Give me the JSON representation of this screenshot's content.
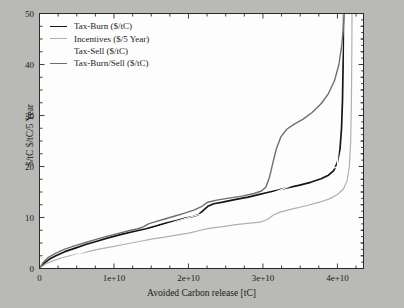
{
  "chart_data": {
    "type": "line",
    "title": "",
    "xlabel": "Avoided Carbon release [tC]",
    "ylabel": "$/tC   $/tC/5 Year",
    "xlim": [
      0,
      43500000000
    ],
    "ylim": [
      0,
      50
    ],
    "grid": false,
    "legend_position": "upper-left",
    "xticks": [
      {
        "value": 0,
        "label": "0"
      },
      {
        "value": 10000000000,
        "label": "1e+10"
      },
      {
        "value": 20000000000,
        "label": "2e+10"
      },
      {
        "value": 30000000000,
        "label": "3e+10"
      },
      {
        "value": 40000000000,
        "label": "4e+10"
      }
    ],
    "yticks": [
      {
        "value": 0,
        "label": "0"
      },
      {
        "value": 10,
        "label": "10"
      },
      {
        "value": 20,
        "label": "20"
      },
      {
        "value": 30,
        "label": "30"
      },
      {
        "value": 40,
        "label": "40"
      },
      {
        "value": 50,
        "label": "50"
      }
    ],
    "x_minor_interval": 2500000000,
    "y_minor_interval": 2.5,
    "series": [
      {
        "name": "Tax-Burn ($/tC)",
        "color": "#151515",
        "width": 1.7,
        "points": [
          [
            0,
            0
          ],
          [
            600000000,
            1.0
          ],
          [
            1300000000,
            1.8
          ],
          [
            2200000000,
            2.5
          ],
          [
            3400000000,
            3.3
          ],
          [
            4800000000,
            4.0
          ],
          [
            6200000000,
            4.7
          ],
          [
            7600000000,
            5.3
          ],
          [
            9200000000,
            6.0
          ],
          [
            11000000000,
            6.7
          ],
          [
            12800000000,
            7.3
          ],
          [
            14300000000,
            7.8
          ],
          [
            15600000000,
            8.3
          ],
          [
            17000000000,
            8.9
          ],
          [
            18400000000,
            9.4
          ],
          [
            19600000000,
            9.9
          ],
          [
            20600000000,
            10.2
          ],
          [
            21400000000,
            10.6
          ],
          [
            22000000000,
            11.4
          ],
          [
            22600000000,
            12.2
          ],
          [
            23400000000,
            12.7
          ],
          [
            24600000000,
            13.0
          ],
          [
            26200000000,
            13.5
          ],
          [
            28000000000,
            14.0
          ],
          [
            29400000000,
            14.5
          ],
          [
            30600000000,
            14.9
          ],
          [
            31800000000,
            15.3
          ],
          [
            33200000000,
            15.8
          ],
          [
            34800000000,
            16.3
          ],
          [
            36400000000,
            16.9
          ],
          [
            37800000000,
            17.6
          ],
          [
            38800000000,
            18.3
          ],
          [
            39500000000,
            19.2
          ],
          [
            40000000000,
            20.8
          ],
          [
            40350000000,
            23.5
          ],
          [
            40550000000,
            27.5
          ],
          [
            40680000000,
            33.0
          ],
          [
            40760000000,
            40.0
          ],
          [
            40800000000,
            47.0
          ],
          [
            40820000000,
            50
          ]
        ]
      },
      {
        "name": "Incentives ($/5 Year)",
        "color": "#b0b0b0",
        "width": 1.2,
        "points": [
          [
            0,
            0
          ],
          [
            800000000,
            0.9
          ],
          [
            1800000000,
            1.5
          ],
          [
            3000000000,
            2.1
          ],
          [
            4600000000,
            2.7
          ],
          [
            6200000000,
            3.2
          ],
          [
            8000000000,
            3.8
          ],
          [
            9800000000,
            4.3
          ],
          [
            11600000000,
            4.8
          ],
          [
            13400000000,
            5.3
          ],
          [
            15200000000,
            5.8
          ],
          [
            17000000000,
            6.2
          ],
          [
            18600000000,
            6.6
          ],
          [
            20200000000,
            7.0
          ],
          [
            21600000000,
            7.5
          ],
          [
            23000000000,
            7.9
          ],
          [
            24600000000,
            8.2
          ],
          [
            26400000000,
            8.6
          ],
          [
            28200000000,
            8.9
          ],
          [
            29600000000,
            9.1
          ],
          [
            30600000000,
            9.6
          ],
          [
            31400000000,
            10.5
          ],
          [
            32400000000,
            11.1
          ],
          [
            34000000000,
            11.7
          ],
          [
            35800000000,
            12.3
          ],
          [
            37600000000,
            13.0
          ],
          [
            39000000000,
            13.7
          ],
          [
            40000000000,
            14.5
          ],
          [
            40800000000,
            15.6
          ],
          [
            41300000000,
            17.2
          ],
          [
            41600000000,
            20.0
          ],
          [
            41780000000,
            25.0
          ],
          [
            41880000000,
            33.0
          ],
          [
            41930000000,
            42.0
          ],
          [
            41960000000,
            50
          ]
        ]
      },
      {
        "name": "Tax-Sell ($/tC)",
        "color": "#fdfdfd",
        "width": 1.2,
        "points": [
          [
            0,
            0
          ],
          [
            10000000000,
            5.5
          ],
          [
            20000000000,
            10.0
          ],
          [
            30000000000,
            14.0
          ],
          [
            40000000000,
            20.0
          ],
          [
            40800000000,
            50
          ]
        ]
      },
      {
        "name": "Tax-Burn/Sell ($/tC)",
        "color": "#6e6e6e",
        "width": 1.4,
        "points": [
          [
            0,
            0
          ],
          [
            500000000,
            1.2
          ],
          [
            1200000000,
            2.2
          ],
          [
            2200000000,
            3.0
          ],
          [
            3400000000,
            3.8
          ],
          [
            4800000000,
            4.5
          ],
          [
            6200000000,
            5.1
          ],
          [
            7600000000,
            5.7
          ],
          [
            9000000000,
            6.3
          ],
          [
            10600000000,
            6.9
          ],
          [
            12000000000,
            7.4
          ],
          [
            13200000000,
            7.8
          ],
          [
            14000000000,
            8.2
          ],
          [
            14700000000,
            8.8
          ],
          [
            15600000000,
            9.2
          ],
          [
            16800000000,
            9.7
          ],
          [
            18200000000,
            10.3
          ],
          [
            19600000000,
            10.9
          ],
          [
            20800000000,
            11.5
          ],
          [
            21800000000,
            12.2
          ],
          [
            22600000000,
            13.0
          ],
          [
            23800000000,
            13.4
          ],
          [
            25400000000,
            13.8
          ],
          [
            27200000000,
            14.2
          ],
          [
            28800000000,
            14.7
          ],
          [
            29800000000,
            15.2
          ],
          [
            30400000000,
            16.0
          ],
          [
            30900000000,
            18.0
          ],
          [
            31300000000,
            20.5
          ],
          [
            31800000000,
            23.5
          ],
          [
            32400000000,
            25.8
          ],
          [
            33200000000,
            27.3
          ],
          [
            34200000000,
            28.3
          ],
          [
            35400000000,
            29.3
          ],
          [
            36600000000,
            30.6
          ],
          [
            37800000000,
            32.3
          ],
          [
            38800000000,
            34.3
          ],
          [
            39600000000,
            36.8
          ],
          [
            40200000000,
            40.0
          ],
          [
            40600000000,
            44.0
          ],
          [
            40820000000,
            48.0
          ],
          [
            40900000000,
            50
          ]
        ]
      }
    ]
  },
  "legend": {
    "entries": [
      {
        "label": "Tax-Burn ($/tC)",
        "color": "#151515"
      },
      {
        "label": "Incentives ($/5 Year)",
        "color": "#b0b0b0"
      },
      {
        "label": "Tax-Sell ($/tC)",
        "color": "#fdfdfd"
      },
      {
        "label": "Tax-Burn/Sell ($/tC)",
        "color": "#6e6e6e"
      }
    ]
  },
  "axes": {
    "x_title": "Avoided Carbon release [tC]",
    "y_title": "$/tC   $/tC/5 Year"
  }
}
